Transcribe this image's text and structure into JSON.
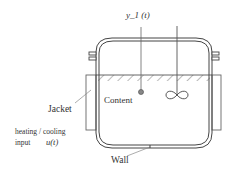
{
  "diagram": {
    "labels": {
      "output": "y_1 (t)",
      "content": "Content",
      "jacket": "Jacket",
      "input_line1": "heating / cooling",
      "input_line2": "input",
      "input_symbol": "u(t)",
      "wall": "Wall"
    },
    "colors": {
      "line": "#555555",
      "text": "#333333",
      "sensor_dot": "#888888",
      "background": "#ffffff"
    }
  }
}
